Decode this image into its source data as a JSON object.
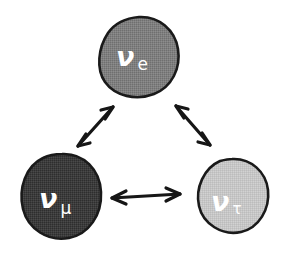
{
  "diagram": {
    "type": "neutrino-oscillation-triangle",
    "background_color": "#ffffff",
    "outline_color": "#1a1a1a",
    "label_color": "#ffffff",
    "nodes": [
      {
        "id": "nu-e",
        "nu_symbol": "ν",
        "flavor_symbol": "e",
        "full_label": "νe",
        "fill_color": "#7f7f7f",
        "position": "top",
        "cx": 139,
        "cy": 57,
        "r": 40
      },
      {
        "id": "nu-mu",
        "nu_symbol": "ν",
        "flavor_symbol": "μ",
        "full_label": "νμ",
        "fill_color": "#3c3c3c",
        "position": "bottom-left",
        "cx": 61,
        "cy": 196,
        "r": 41
      },
      {
        "id": "nu-tau",
        "nu_symbol": "ν",
        "flavor_symbol": "τ",
        "full_label": "ντ",
        "fill_color": "#c6c6c6",
        "position": "bottom-right",
        "cx": 232,
        "cy": 196,
        "r": 37
      }
    ],
    "connectors": [
      {
        "id": "arrow-nu-mu-nu-e",
        "from": "nu-mu",
        "to": "nu-e",
        "style": "double-headed",
        "orientation": "diagonal-up-right"
      },
      {
        "id": "arrow-nu-e-nu-tau",
        "from": "nu-e",
        "to": "nu-tau",
        "style": "double-headed",
        "orientation": "diagonal-down-right"
      },
      {
        "id": "arrow-nu-mu-nu-tau",
        "from": "nu-mu",
        "to": "nu-tau",
        "style": "double-headed",
        "orientation": "horizontal"
      }
    ]
  }
}
